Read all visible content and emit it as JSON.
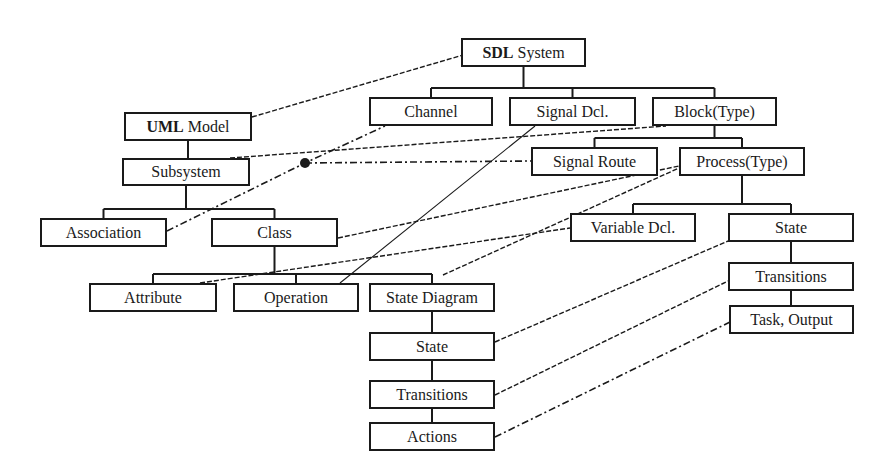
{
  "diagram": {
    "type": "mapping",
    "colors": {
      "line": "#1a1a1a",
      "box_border": "#1a1a1a",
      "background": "#ffffff"
    },
    "nodes": [
      {
        "id": "sdl_system",
        "bold": "SDL",
        "label": "System",
        "x": 461,
        "y": 38,
        "w": 125,
        "h": 29
      },
      {
        "id": "uml_model",
        "bold": "UML",
        "label": "Model",
        "x": 124,
        "y": 112,
        "w": 128,
        "h": 29
      },
      {
        "id": "channel",
        "bold": "",
        "label": "Channel",
        "x": 369,
        "y": 97,
        "w": 124,
        "h": 29
      },
      {
        "id": "signal_dcl",
        "bold": "",
        "label": "Signal Dcl.",
        "x": 509,
        "y": 97,
        "w": 127,
        "h": 29
      },
      {
        "id": "block_type",
        "bold": "",
        "label": "Block(Type)",
        "x": 652,
        "y": 97,
        "w": 125,
        "h": 29
      },
      {
        "id": "subsystem",
        "bold": "",
        "label": "Subsystem",
        "x": 122,
        "y": 158,
        "w": 128,
        "h": 28
      },
      {
        "id": "signal_route",
        "bold": "",
        "label": "Signal Route",
        "x": 531,
        "y": 147,
        "w": 127,
        "h": 29
      },
      {
        "id": "process_type",
        "bold": "",
        "label": "Process(Type)",
        "x": 679,
        "y": 147,
        "w": 126,
        "h": 29
      },
      {
        "id": "association",
        "bold": "",
        "label": "Association",
        "x": 40,
        "y": 218,
        "w": 127,
        "h": 29
      },
      {
        "id": "class",
        "bold": "",
        "label": "Class",
        "x": 211,
        "y": 218,
        "w": 127,
        "h": 29
      },
      {
        "id": "variable_dcl",
        "bold": "",
        "label": "Variable Dcl.",
        "x": 570,
        "y": 213,
        "w": 126,
        "h": 29
      },
      {
        "id": "sdl_state",
        "bold": "",
        "label": "State",
        "x": 728,
        "y": 213,
        "w": 126,
        "h": 29
      },
      {
        "id": "attribute",
        "bold": "",
        "label": "Attribute",
        "x": 89,
        "y": 283,
        "w": 128,
        "h": 29
      },
      {
        "id": "operation",
        "bold": "",
        "label": "Operation",
        "x": 233,
        "y": 283,
        "w": 126,
        "h": 29
      },
      {
        "id": "state_diagram",
        "bold": "",
        "label": "State Diagram",
        "x": 369,
        "y": 283,
        "w": 126,
        "h": 29
      },
      {
        "id": "sdl_transitions",
        "bold": "",
        "label": "Transitions",
        "x": 728,
        "y": 262,
        "w": 126,
        "h": 29
      },
      {
        "id": "task_output",
        "bold": "",
        "label": "Task, Output",
        "x": 729,
        "y": 305,
        "w": 125,
        "h": 29
      },
      {
        "id": "uml_state",
        "bold": "",
        "label": "State",
        "x": 369,
        "y": 332,
        "w": 126,
        "h": 29
      },
      {
        "id": "uml_transitions",
        "bold": "",
        "label": "Transitions",
        "x": 369,
        "y": 380,
        "w": 126,
        "h": 29
      },
      {
        "id": "actions",
        "bold": "",
        "label": "Actions",
        "x": 369,
        "y": 422,
        "w": 126,
        "h": 29
      }
    ],
    "tree_edges": [
      {
        "from": "sdl_system",
        "to": [
          "channel",
          "signal_dcl",
          "block_type"
        ]
      },
      {
        "from": "block_type",
        "to": [
          "signal_route",
          "process_type"
        ]
      },
      {
        "from": "process_type",
        "to": [
          "variable_dcl",
          "sdl_state"
        ]
      },
      {
        "from": "sdl_state",
        "to": [
          "sdl_transitions"
        ]
      },
      {
        "from": "sdl_transitions",
        "to": [
          "task_output"
        ]
      },
      {
        "from": "uml_model",
        "to": [
          "subsystem"
        ]
      },
      {
        "from": "subsystem",
        "to": [
          "association",
          "class"
        ]
      },
      {
        "from": "class",
        "to": [
          "attribute",
          "operation",
          "state_diagram"
        ]
      },
      {
        "from": "state_diagram",
        "to": [
          "uml_state"
        ]
      },
      {
        "from": "uml_state",
        "to": [
          "uml_transitions"
        ]
      },
      {
        "from": "uml_transitions",
        "to": [
          "actions"
        ]
      }
    ],
    "mappings": [
      {
        "uml": "uml_model",
        "sdl": "sdl_system",
        "style": "dashed",
        "pts": [
          [
            252,
            117
          ],
          [
            463,
            55
          ]
        ]
      },
      {
        "uml": "subsystem",
        "sdl": "block_type",
        "style": "dashed",
        "pts": [
          [
            230,
            158
          ],
          [
            666,
            126
          ]
        ]
      },
      {
        "uml": "association",
        "sdl": "channel",
        "style": "dashdot",
        "pts": [
          [
            167,
            231
          ],
          [
            305,
            163
          ],
          [
            385,
            126
          ]
        ]
      },
      {
        "uml": "association",
        "sdl": "signal_route",
        "style": "dashdot",
        "pts": [
          [
            305,
            163
          ],
          [
            531,
            161
          ]
        ]
      },
      {
        "uml": "class",
        "sdl": "process_type",
        "style": "dashed",
        "pts": [
          [
            338,
            238
          ],
          [
            679,
            166
          ]
        ]
      },
      {
        "uml": "operation",
        "sdl": "signal_dcl",
        "style": "solid-thin",
        "pts": [
          [
            340,
            283
          ],
          [
            535,
            126
          ]
        ]
      },
      {
        "uml": "attribute",
        "sdl": "variable_dcl",
        "style": "dashed",
        "pts": [
          [
            200,
            283
          ],
          [
            570,
            228
          ]
        ]
      },
      {
        "uml": "state_diagram",
        "sdl": "process_type",
        "style": "dashed",
        "pts": [
          [
            443,
            275
          ],
          [
            679,
            168
          ]
        ]
      },
      {
        "uml": "uml_state",
        "sdl": "sdl_state",
        "style": "dashed",
        "pts": [
          [
            495,
            342
          ],
          [
            728,
            241
          ]
        ]
      },
      {
        "uml": "uml_transitions",
        "sdl": "sdl_transitions",
        "style": "dashed",
        "pts": [
          [
            495,
            395
          ],
          [
            728,
            281
          ]
        ]
      },
      {
        "uml": "actions",
        "sdl": "task_output",
        "style": "dashdot",
        "pts": [
          [
            495,
            437
          ],
          [
            730,
            322
          ]
        ]
      }
    ],
    "junction_dot": {
      "x": 305,
      "y": 163,
      "r": 5
    }
  }
}
